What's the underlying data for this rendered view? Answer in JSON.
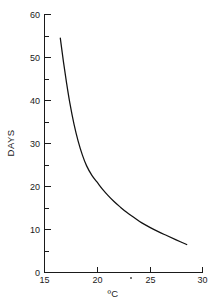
{
  "chart_data": {
    "type": "line",
    "title": "",
    "xlabel": "ºC",
    "ylabel": "DAYS",
    "xlim": [
      15,
      30
    ],
    "ylim": [
      0,
      60
    ],
    "grid": false,
    "legend": null,
    "x_ticks": [
      15,
      20,
      25,
      30
    ],
    "x_tick_labels": [
      "15",
      "20",
      "25",
      "30"
    ],
    "x_minor_ticks": [],
    "y_ticks": [
      0,
      10,
      20,
      30,
      40,
      50,
      60
    ],
    "y_tick_labels": [
      "0",
      "10",
      "20",
      "30",
      "40",
      "50",
      "60"
    ],
    "y_minor_ticks": [
      5,
      15,
      25,
      35,
      45,
      55
    ],
    "series": [
      {
        "name": "development-time",
        "color": "#111111",
        "x": [
          16.5,
          16.8,
          17.1,
          17.4,
          17.8,
          18.2,
          18.6,
          19.0,
          19.5,
          20.0,
          20.5,
          21.0,
          21.6,
          22.2,
          22.8,
          23.5,
          24.2,
          25.0,
          25.8,
          26.6,
          27.5,
          28.5
        ],
        "y": [
          54.5,
          49.0,
          44.0,
          39.5,
          34.5,
          30.5,
          27.3,
          24.8,
          22.6,
          21.0,
          19.4,
          18.0,
          16.5,
          15.2,
          14.0,
          12.8,
          11.6,
          10.5,
          9.5,
          8.6,
          7.6,
          6.5
        ]
      }
    ],
    "annotations": [
      {
        "name": "speck-artifact",
        "x": 23.3,
        "note": ""
      }
    ]
  },
  "axes": {
    "y_title": "DAYS",
    "x_title": "ºC"
  }
}
